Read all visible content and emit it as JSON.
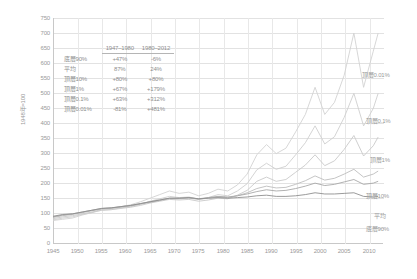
{
  "chart_data": {
    "type": "line",
    "title": "",
    "xlabel": "",
    "ylabel": "1948年=100",
    "xlim": [
      1945,
      2013
    ],
    "ylim": [
      0,
      750
    ],
    "grid": true,
    "legend_position": "right-inline",
    "x_ticks": [
      "1945",
      "1950",
      "1955",
      "1960",
      "1965",
      "1970",
      "1975",
      "1980",
      "1985",
      "1990",
      "1995",
      "2000",
      "2005",
      "2010"
    ],
    "y_ticks": [
      "750",
      "700",
      "650",
      "600",
      "550",
      "500",
      "450",
      "400",
      "350",
      "300",
      "250",
      "200",
      "150",
      "100",
      "50",
      "0"
    ],
    "x": [
      1945,
      1947,
      1949,
      1951,
      1953,
      1955,
      1957,
      1959,
      1961,
      1963,
      1965,
      1967,
      1969,
      1971,
      1973,
      1975,
      1977,
      1979,
      1981,
      1983,
      1985,
      1987,
      1989,
      1991,
      1993,
      1995,
      1997,
      1999,
      2001,
      2003,
      2005,
      2007,
      2009,
      2011,
      2012
    ],
    "series": [
      {
        "name": "頂層0.01%",
        "color": "#d2d2d2",
        "values": [
          78,
          82,
          86,
          96,
          104,
          116,
          118,
          124,
          130,
          140,
          152,
          164,
          176,
          168,
          172,
          160,
          168,
          182,
          176,
          196,
          232,
          296,
          330,
          300,
          318,
          372,
          430,
          520,
          430,
          470,
          560,
          700,
          520,
          640,
          700
        ]
      },
      {
        "name": "頂層0.1%",
        "color": "#cfcfcf",
        "values": [
          80,
          86,
          90,
          98,
          104,
          112,
          114,
          120,
          124,
          132,
          142,
          150,
          158,
          154,
          156,
          148,
          154,
          164,
          160,
          176,
          200,
          246,
          268,
          248,
          258,
          296,
          336,
          392,
          332,
          356,
          420,
          500,
          392,
          450,
          500
        ]
      },
      {
        "name": "頂層1%",
        "color": "#c9c9c9",
        "values": [
          84,
          90,
          94,
          100,
          106,
          112,
          114,
          118,
          122,
          128,
          136,
          142,
          148,
          146,
          148,
          142,
          146,
          152,
          150,
          162,
          178,
          208,
          222,
          208,
          214,
          238,
          262,
          296,
          260,
          276,
          314,
          360,
          292,
          326,
          355
        ]
      },
      {
        "name": "頂層10%",
        "color": "#bdbdbd",
        "values": [
          88,
          94,
          98,
          104,
          110,
          116,
          118,
          122,
          126,
          132,
          138,
          144,
          150,
          150,
          152,
          148,
          152,
          156,
          154,
          160,
          170,
          184,
          192,
          186,
          188,
          198,
          210,
          226,
          212,
          218,
          232,
          248,
          222,
          232,
          242
        ]
      },
      {
        "name": "平均",
        "color": "#a8a8a8",
        "values": [
          90,
          96,
          100,
          106,
          112,
          118,
          120,
          124,
          128,
          134,
          140,
          146,
          152,
          152,
          154,
          150,
          154,
          158,
          156,
          160,
          166,
          174,
          180,
          176,
          178,
          184,
          192,
          202,
          194,
          198,
          206,
          214,
          198,
          202,
          208
        ]
      },
      {
        "name": "底層90%",
        "color": "#8f8f8f",
        "values": [
          92,
          98,
          100,
          106,
          112,
          118,
          120,
          124,
          128,
          134,
          140,
          146,
          152,
          152,
          154,
          150,
          152,
          154,
          152,
          154,
          156,
          160,
          162,
          158,
          158,
          160,
          164,
          170,
          166,
          166,
          168,
          170,
          158,
          156,
          158
        ]
      }
    ],
    "summary": {
      "periods": [
        "1947–1980",
        "1980–2012"
      ],
      "rows": [
        {
          "label": "底層90%",
          "values": [
            "+47%",
            "-6%"
          ]
        },
        {
          "label": "平均",
          "values": [
            "87%",
            "24%"
          ]
        },
        {
          "label": "頂層10%",
          "values": [
            "+80%",
            "+80%"
          ]
        },
        {
          "label": "頂層1%",
          "values": [
            "+67%",
            "+179%"
          ]
        },
        {
          "label": "頂層0.1%",
          "values": [
            "+63%",
            "+312%"
          ]
        },
        {
          "label": "頂層0.01%",
          "values": [
            "-81%",
            "+481%"
          ]
        }
      ]
    },
    "series_end_labels": [
      {
        "text": "頂層0.01%",
        "top": 72
      },
      {
        "text": "頂層0.1%",
        "top": 118
      },
      {
        "text": "頂層1%",
        "top": 157
      },
      {
        "text": "頂層10%",
        "top": 193
      },
      {
        "text": "平均",
        "top": 213
      },
      {
        "text": "底層90%",
        "top": 226
      }
    ]
  }
}
